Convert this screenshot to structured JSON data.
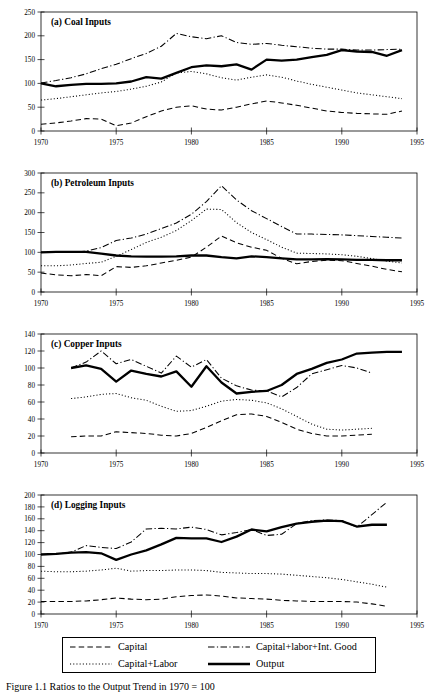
{
  "figure": {
    "caption": "Figure 1.1 Ratios to the Output Trend in 1970 = 100",
    "x_axis": {
      "label": "",
      "min": 1970,
      "max": 1995,
      "ticks": [
        1970,
        1975,
        1980,
        1985,
        1990,
        1995
      ]
    },
    "legend": {
      "entries": [
        {
          "key": "capital",
          "label": "Capital",
          "style": "dashed"
        },
        {
          "key": "capital_labor_int",
          "label": "Capital+labor+Int. Good",
          "style": "dash-dot"
        },
        {
          "key": "capital_labor",
          "label": "Capital+Labor",
          "style": "dotted"
        },
        {
          "key": "output",
          "label": "Output",
          "style": "solid-bold"
        }
      ],
      "order": [
        "capital",
        "capital_labor_int",
        "capital_labor",
        "output"
      ]
    }
  },
  "chart_data": [
    {
      "id": "panel-a",
      "type": "line",
      "title": "(a) Coal Inputs",
      "xlabel": "",
      "ylabel": "",
      "xlim": [
        1970,
        1995
      ],
      "ylim": [
        0,
        250
      ],
      "yticks": [
        0,
        50,
        100,
        150,
        200,
        250
      ],
      "xticks": [
        1970,
        1975,
        1980,
        1985,
        1990,
        1995
      ],
      "grid": false,
      "legend_position": "figure-bottom",
      "x": [
        1970,
        1971,
        1972,
        1973,
        1974,
        1975,
        1976,
        1977,
        1978,
        1979,
        1980,
        1981,
        1982,
        1983,
        1984,
        1985,
        1986,
        1987,
        1988,
        1989,
        1990,
        1991,
        1992,
        1993,
        1994
      ],
      "series": [
        {
          "name": "Capital",
          "key": "capital",
          "values": [
            14,
            17,
            21,
            26,
            25,
            11,
            17,
            30,
            42,
            50,
            53,
            46,
            44,
            50,
            57,
            63,
            59,
            54,
            48,
            42,
            39,
            37,
            36,
            35,
            42
          ]
        },
        {
          "name": "Capital+Labor",
          "key": "capital_labor",
          "values": [
            65,
            68,
            72,
            76,
            80,
            83,
            88,
            94,
            103,
            122,
            125,
            120,
            112,
            107,
            113,
            118,
            113,
            105,
            98,
            92,
            86,
            80,
            76,
            72,
            68
          ]
        },
        {
          "name": "Capital+labor+Int. Good",
          "key": "capital_labor_int",
          "values": [
            101,
            106,
            112,
            120,
            131,
            140,
            152,
            163,
            178,
            205,
            198,
            194,
            200,
            186,
            182,
            184,
            180,
            177,
            174,
            172,
            172,
            170,
            170,
            171,
            172
          ]
        },
        {
          "name": "Output",
          "key": "output",
          "values": [
            100,
            94,
            97,
            99,
            99,
            100,
            104,
            113,
            110,
            122,
            134,
            138,
            136,
            140,
            129,
            150,
            148,
            150,
            155,
            160,
            170,
            167,
            166,
            158,
            170
          ]
        }
      ]
    },
    {
      "id": "panel-b",
      "type": "line",
      "title": "(b) Petroleum Inputs",
      "xlabel": "",
      "ylabel": "",
      "xlim": [
        1970,
        1995
      ],
      "ylim": [
        0,
        300
      ],
      "yticks": [
        0,
        50,
        100,
        150,
        200,
        250,
        300
      ],
      "xticks": [
        1970,
        1975,
        1980,
        1985,
        1990,
        1995
      ],
      "grid": false,
      "legend_position": "figure-bottom",
      "x": [
        1970,
        1971,
        1972,
        1973,
        1974,
        1975,
        1976,
        1977,
        1978,
        1979,
        1980,
        1981,
        1982,
        1983,
        1984,
        1985,
        1986,
        1987,
        1988,
        1989,
        1990,
        1991,
        1992,
        1993,
        1994
      ],
      "series": [
        {
          "name": "Capital",
          "key": "capital",
          "values": [
            48,
            43,
            41,
            44,
            41,
            64,
            62,
            66,
            73,
            80,
            88,
            113,
            141,
            124,
            113,
            105,
            85,
            71,
            77,
            80,
            79,
            72,
            65,
            57,
            51
          ]
        },
        {
          "name": "Capital+Labor",
          "key": "capital_labor",
          "values": [
            66,
            66,
            68,
            72,
            75,
            90,
            107,
            125,
            138,
            155,
            180,
            209,
            208,
            175,
            150,
            132,
            113,
            98,
            97,
            96,
            94,
            90,
            84,
            78,
            73
          ]
        },
        {
          "name": "Capital+labor+Int. Good",
          "key": "capital_labor_int",
          "values": [
            100,
            100,
            100,
            103,
            112,
            130,
            136,
            146,
            160,
            174,
            196,
            228,
            268,
            232,
            205,
            185,
            165,
            146,
            146,
            145,
            144,
            142,
            140,
            138,
            136
          ]
        },
        {
          "name": "Output",
          "key": "output",
          "values": [
            100,
            101,
            101,
            101,
            97,
            92,
            90,
            89,
            89,
            90,
            92,
            92,
            88,
            85,
            90,
            88,
            85,
            82,
            82,
            83,
            82,
            81,
            81,
            80,
            80
          ]
        }
      ]
    },
    {
      "id": "panel-c",
      "type": "line",
      "title": "(c) Copper Inputs",
      "xlabel": "",
      "ylabel": "",
      "xlim": [
        1970,
        1995
      ],
      "ylim": [
        0,
        140
      ],
      "yticks": [
        0,
        20,
        40,
        60,
        80,
        100,
        120,
        140
      ],
      "xticks": [
        1970,
        1975,
        1980,
        1985,
        1990,
        1995
      ],
      "grid": false,
      "legend_position": "figure-bottom",
      "x": [
        1972,
        1973,
        1974,
        1975,
        1976,
        1977,
        1978,
        1979,
        1980,
        1981,
        1982,
        1983,
        1984,
        1985,
        1986,
        1987,
        1988,
        1989,
        1990,
        1991,
        1992,
        1993,
        1994
      ],
      "series": [
        {
          "name": "Capital",
          "key": "capital",
          "values": [
            19,
            20,
            20,
            25,
            24,
            23,
            21,
            20,
            23,
            30,
            38,
            45,
            46,
            43,
            36,
            28,
            23,
            20,
            20,
            21,
            22,
            null,
            null
          ]
        },
        {
          "name": "Capital+Labor",
          "key": "capital_labor",
          "values": [
            64,
            66,
            69,
            70,
            65,
            62,
            55,
            49,
            50,
            55,
            61,
            63,
            62,
            59,
            52,
            43,
            34,
            28,
            27,
            28,
            29,
            null,
            null
          ]
        },
        {
          "name": "Capital+labor+Int. Good",
          "key": "capital_labor_int",
          "values": [
            100,
            107,
            120,
            105,
            110,
            102,
            94,
            114,
            101,
            110,
            88,
            79,
            74,
            73,
            66,
            77,
            93,
            98,
            103,
            100,
            94,
            null,
            null
          ]
        },
        {
          "name": "Output",
          "key": "output",
          "values": [
            100,
            103,
            99,
            84,
            97,
            93,
            90,
            96,
            78,
            102,
            83,
            70,
            72,
            73,
            80,
            93,
            99,
            106,
            110,
            117,
            118,
            119,
            119
          ]
        }
      ]
    },
    {
      "id": "panel-d",
      "type": "line",
      "title": "(d) Logging Inputs",
      "xlabel": "",
      "ylabel": "",
      "xlim": [
        1970,
        1995
      ],
      "ylim": [
        0,
        200
      ],
      "yticks": [
        0,
        20,
        40,
        60,
        80,
        100,
        120,
        140,
        160,
        180,
        200
      ],
      "xticks": [
        1970,
        1975,
        1980,
        1985,
        1990,
        1995
      ],
      "grid": false,
      "legend_position": "figure-bottom",
      "x": [
        1970,
        1971,
        1972,
        1973,
        1974,
        1975,
        1976,
        1977,
        1978,
        1979,
        1980,
        1981,
        1982,
        1983,
        1984,
        1985,
        1986,
        1987,
        1988,
        1989,
        1990,
        1991,
        1992,
        1993
      ],
      "series": [
        {
          "name": "Capital",
          "key": "capital",
          "values": [
            21,
            21,
            21,
            22,
            24,
            27,
            25,
            24,
            25,
            29,
            31,
            32,
            30,
            27,
            26,
            25,
            23,
            22,
            21,
            21,
            21,
            20,
            17,
            13
          ]
        },
        {
          "name": "Capital+Labor",
          "key": "capital_labor",
          "values": [
            72,
            71,
            71,
            72,
            74,
            77,
            72,
            73,
            73,
            74,
            74,
            73,
            70,
            69,
            68,
            68,
            67,
            65,
            63,
            61,
            58,
            54,
            50,
            45
          ]
        },
        {
          "name": "Capital+labor+Int. Good",
          "key": "capital_labor_int",
          "values": [
            100,
            101,
            104,
            115,
            112,
            110,
            121,
            143,
            144,
            143,
            146,
            142,
            133,
            137,
            142,
            132,
            134,
            152,
            157,
            158,
            157,
            146,
            167,
            188
          ]
        },
        {
          "name": "Output",
          "key": "output",
          "values": [
            100,
            101,
            103,
            104,
            102,
            91,
            100,
            107,
            117,
            128,
            127,
            127,
            121,
            130,
            142,
            139,
            146,
            152,
            155,
            157,
            156,
            147,
            150,
            150
          ]
        }
      ]
    }
  ]
}
